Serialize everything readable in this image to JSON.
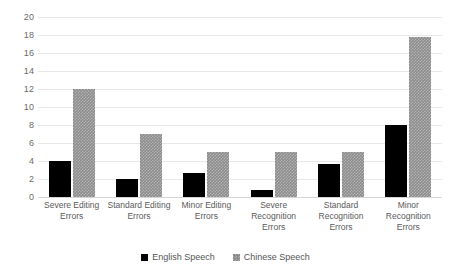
{
  "chart_data": {
    "type": "bar",
    "title": "",
    "xlabel": "",
    "ylabel": "",
    "ylim": [
      0,
      20
    ],
    "y_ticks": [
      0,
      2,
      4,
      6,
      8,
      10,
      12,
      14,
      16,
      18,
      20
    ],
    "grid": true,
    "legend_position": "bottom",
    "categories": [
      "Severe Editing Errors",
      "Standard Editing Errors",
      "Minor Editing Errors",
      "Severe Recognition Errors",
      "Standard Recognition Errors",
      "Minor Recognition Errors"
    ],
    "category_lines": [
      [
        "Severe Editing",
        "Errors"
      ],
      [
        "Standard Editing",
        "Errors"
      ],
      [
        "Minor Editing",
        "Errors"
      ],
      [
        "Severe",
        "Recognition",
        "Errors"
      ],
      [
        "Standard",
        "Recognition",
        "Errors"
      ],
      [
        "Minor",
        "Recognition",
        "Errors"
      ]
    ],
    "series": [
      {
        "name": "English Speech",
        "color": "#000000",
        "values": [
          4,
          2,
          2.7,
          0.8,
          3.7,
          8
        ]
      },
      {
        "name": "Chinese Speech",
        "color": "#8c8c8c",
        "values": [
          12,
          7,
          5,
          5,
          5,
          17.8
        ]
      }
    ]
  },
  "axis": {
    "y_tick_labels": [
      "0",
      "2",
      "4",
      "6",
      "8",
      "10",
      "12",
      "14",
      "16",
      "18",
      "20"
    ]
  },
  "legend": {
    "items": [
      {
        "label": "English Speech"
      },
      {
        "label": "Chinese Speech"
      }
    ]
  }
}
